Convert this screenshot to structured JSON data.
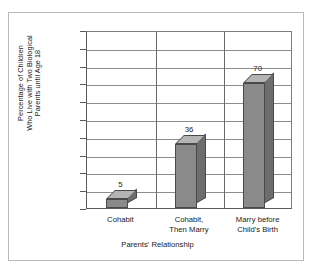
{
  "chart_data": {
    "type": "bar",
    "title": "",
    "subtitle": "",
    "categories": [
      "Cohabit",
      "Cohabit, Then Marry",
      "Marry before Child's Birth"
    ],
    "category_lines": [
      [
        "Cohabit"
      ],
      [
        "Cohabit,",
        "Then Marry"
      ],
      [
        "Marry before",
        "Child's Birth"
      ]
    ],
    "values": [
      5,
      36,
      70
    ],
    "data_labels": [
      "5",
      "36",
      "70"
    ],
    "xlabel": "Parents' Relationship",
    "ylabel": "Percentage of Children Who Live with Two Biological Parents until Age 18",
    "ylabel_lines": [
      "Percentage of Children",
      "Who Live with Two Biological",
      "Parents until Age 18"
    ],
    "ylim": [
      0,
      100
    ],
    "ytick_step": 10,
    "yticks": [
      0,
      10,
      20,
      30,
      40,
      50,
      60,
      70,
      80,
      90,
      100
    ],
    "ytick_labels": [
      "0",
      "10",
      "20",
      "30",
      "40",
      "50",
      "60",
      "70",
      "80",
      "90",
      "100"
    ],
    "grid": true,
    "grid_axis": "y",
    "legend": false,
    "legend_position": "none",
    "style": "3d-column",
    "colors": {
      "bar_front": "#8a8a8a",
      "bar_side": "#6d6d6d",
      "bar_top": "#b4b4b4",
      "bar_outline": "#4a4a4a",
      "gridline": "#8e8e8e",
      "axis": "#5a5a5a",
      "divider": "#6a6a6a",
      "frame": "#b9b9b9",
      "background": "#ffffff",
      "text": "#1a1a1a"
    }
  }
}
